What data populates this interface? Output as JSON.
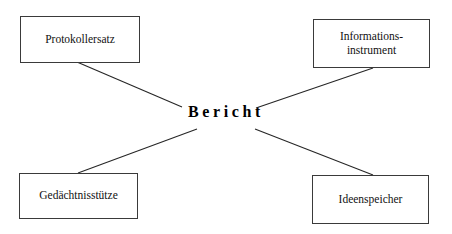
{
  "diagram": {
    "center": {
      "label": "Bericht"
    },
    "nodes": [
      {
        "id": "protokollersatz",
        "label": "Protokollersatz",
        "position": "top-left"
      },
      {
        "id": "informationsinstrument",
        "label": "Informations-\ninstrument",
        "position": "top-right"
      },
      {
        "id": "gedaechtnisstuetze",
        "label": "Gedächtnisstütze",
        "position": "bottom-left"
      },
      {
        "id": "ideenspeicher",
        "label": "Ideenspeicher",
        "position": "bottom-right"
      }
    ],
    "connectors": [
      {
        "from": "protokollersatz",
        "to": "center",
        "x1": 77,
        "y1": 62,
        "x2": 182,
        "y2": 107
      },
      {
        "from": "informationsinstrument",
        "to": "center",
        "x1": 373,
        "y1": 68,
        "x2": 256,
        "y2": 108
      },
      {
        "from": "gedaechtnisstuetze",
        "to": "center",
        "x1": 78,
        "y1": 173,
        "x2": 197,
        "y2": 129
      },
      {
        "from": "ideenspeicher",
        "to": "center",
        "x1": 373,
        "y1": 175,
        "x2": 255,
        "y2": 129
      }
    ],
    "colors": {
      "background": "#ffffff",
      "box_border": "#3a3a3a",
      "connector": "#262626",
      "text": "#111111",
      "center_text": "#000000"
    }
  }
}
